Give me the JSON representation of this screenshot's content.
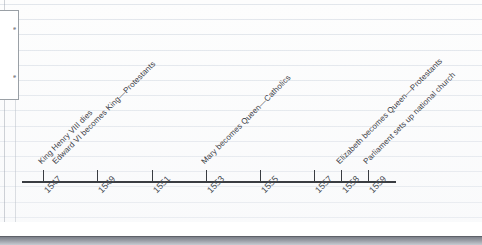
{
  "document": {
    "type": "hand-drawn historical timeline",
    "background": "ruled notebook paper",
    "axis_color": "#3a3d42"
  },
  "left_panel": {
    "fragment_1": "e",
    "fragment_2": "e"
  },
  "chart_data": {
    "type": "timeline",
    "title": "",
    "xlabel": "",
    "ylabel": "",
    "axis_range": [
      1547,
      1559
    ],
    "grid": true,
    "legend_position": "none",
    "tick_labels": [
      "1547",
      "1549",
      "1551",
      "1553",
      "1555",
      "1557",
      "1558",
      "1559"
    ],
    "tick_values": [
      1547,
      1549,
      1551,
      1553,
      1555,
      1557,
      1558,
      1559
    ],
    "tick_x_px": [
      43,
      97,
      152,
      206,
      260,
      314,
      341,
      368
    ],
    "events": [
      {
        "year": 1547,
        "label": "King Henry VIII dies",
        "x_px": 43,
        "anchor_y_px": 166,
        "row": 0
      },
      {
        "year": 1547,
        "label": "Edward VI becomes King—Protestants",
        "x_px": 57,
        "anchor_y_px": 166,
        "row": 1
      },
      {
        "year": 1553,
        "label": "Mary becomes Queen—Catholics",
        "x_px": 206,
        "anchor_y_px": 166,
        "row": 0
      },
      {
        "year": 1558,
        "label": "Elizabeth becomes Queen—Protestants",
        "x_px": 341,
        "anchor_y_px": 166,
        "row": 0
      },
      {
        "year": 1559,
        "label": "Parliament sets up national church",
        "x_px": 368,
        "anchor_y_px": 166,
        "row": 1
      }
    ]
  }
}
